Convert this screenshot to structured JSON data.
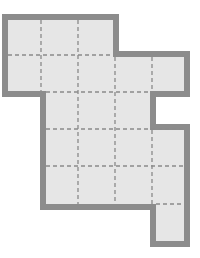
{
  "diagram": {
    "colors": {
      "fill": "#e6e6e6",
      "border": "#8c8c8c",
      "grid": "#8a8a8a",
      "background": "#ffffff"
    },
    "cell_size_px": 37,
    "cells": [
      [
        0,
        0
      ],
      [
        1,
        0
      ],
      [
        2,
        0
      ],
      [
        0,
        1
      ],
      [
        1,
        1
      ],
      [
        2,
        1
      ],
      [
        3,
        1
      ],
      [
        4,
        1
      ],
      [
        1,
        2
      ],
      [
        2,
        2
      ],
      [
        3,
        2
      ],
      [
        1,
        3
      ],
      [
        2,
        3
      ],
      [
        3,
        3
      ],
      [
        4,
        3
      ],
      [
        1,
        4
      ],
      [
        2,
        4
      ],
      [
        3,
        4
      ],
      [
        4,
        4
      ],
      [
        4,
        5
      ]
    ],
    "cell_count": 20
  }
}
